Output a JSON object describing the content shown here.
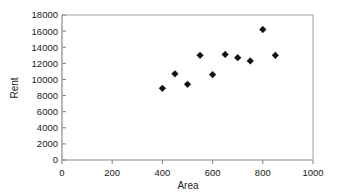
{
  "chart_data": {
    "type": "scatter",
    "title": "",
    "xlabel": "Area",
    "ylabel": "Rent",
    "xlim": [
      0,
      1000
    ],
    "ylim": [
      0,
      18000
    ],
    "grid": false,
    "legend": null,
    "x_ticks": [
      0,
      200,
      400,
      600,
      800,
      1000
    ],
    "y_ticks": [
      0,
      2000,
      4000,
      6000,
      8000,
      10000,
      12000,
      14000,
      16000,
      18000
    ],
    "x_tick_labels": [
      "0",
      "200",
      "400",
      "600",
      "800",
      "1000"
    ],
    "y_tick_labels": [
      "0",
      "2000",
      "4000",
      "6000",
      "8000",
      "10000",
      "12000",
      "14000",
      "16000",
      "18000"
    ],
    "marker": "diamond",
    "marker_color": "#111111",
    "points": [
      {
        "x": 400,
        "y": 8900
      },
      {
        "x": 450,
        "y": 10700
      },
      {
        "x": 500,
        "y": 9400
      },
      {
        "x": 550,
        "y": 13000
      },
      {
        "x": 600,
        "y": 10600
      },
      {
        "x": 650,
        "y": 13100
      },
      {
        "x": 700,
        "y": 12700
      },
      {
        "x": 750,
        "y": 12300
      },
      {
        "x": 800,
        "y": 16200
      },
      {
        "x": 850,
        "y": 13000
      }
    ]
  },
  "axis": {
    "x_title": "Area",
    "y_title": "Rent"
  }
}
